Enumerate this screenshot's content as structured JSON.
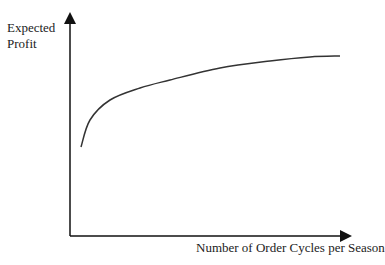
{
  "chart_data": {
    "type": "line",
    "title": "",
    "xlabel": "Number of Order Cycles per Season",
    "ylabel": [
      "Expected",
      "Profit"
    ],
    "ticks": "none",
    "grid": false,
    "series": [
      {
        "name": "Expected Profit",
        "description": "Concave increasing curve that rises steeply then flattens",
        "points_px": [
          [
            81,
            147
          ],
          [
            90,
            120
          ],
          [
            110,
            100
          ],
          [
            140,
            88
          ],
          [
            170,
            80
          ],
          [
            220,
            68
          ],
          [
            270,
            61
          ],
          [
            310,
            57
          ],
          [
            340,
            56
          ]
        ]
      }
    ],
    "colors": {
      "axis": "#111111",
      "curve": "#333333"
    }
  },
  "labels": {
    "y_line1": "Expected",
    "y_line2": "Profit",
    "x": "Number of Order Cycles per Season"
  }
}
